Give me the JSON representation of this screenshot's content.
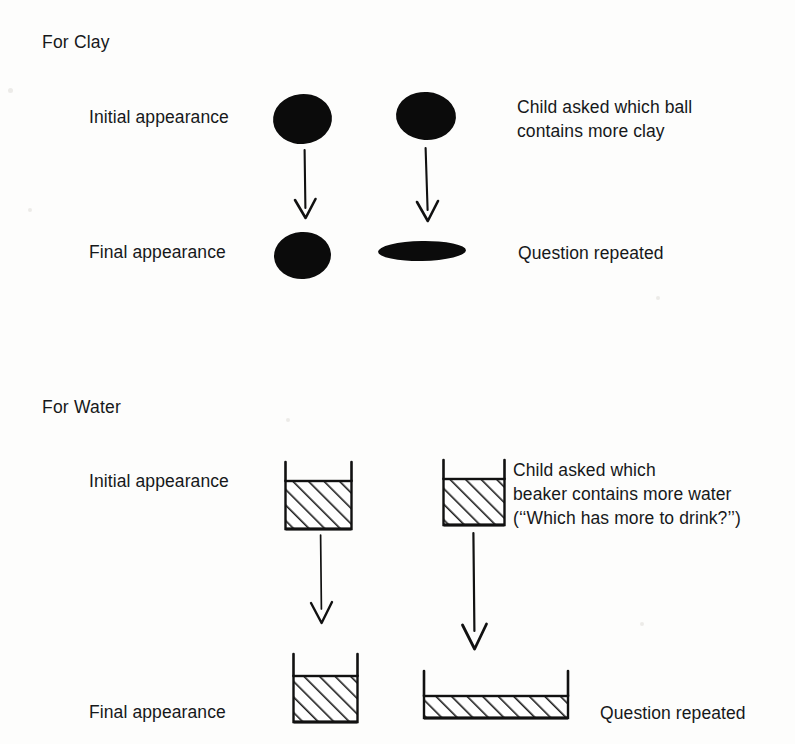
{
  "figure": {
    "title_clay": "For Clay",
    "title_water": "For Water",
    "ink_color": "#0b0b0b",
    "background_color": "#fdfdfc"
  },
  "clay_section": {
    "heading": "For Clay",
    "rows": [
      {
        "label": "Initial appearance",
        "note": "Child asked which ball\ncontains more clay",
        "note_line_1": "Child asked which ball",
        "note_line_2": "contains more clay",
        "left_shape": "circle-ball",
        "right_shape": "circle-ball"
      },
      {
        "label": "Final appearance",
        "note": "Question repeated",
        "left_shape": "circle-ball",
        "right_shape": "flattened-pancake"
      }
    ],
    "transform_arrows": 2
  },
  "water_section": {
    "heading": "For Water",
    "rows": [
      {
        "label": "Initial appearance",
        "note_line_1": "Child asked which",
        "note_line_2": "beaker contains more water",
        "note_line_3": "(‘‘Which has more to drink?’’)",
        "left_shape": "tall-beaker-filled",
        "right_shape": "tall-beaker-filled"
      },
      {
        "label": "Final appearance",
        "note": "Question repeated",
        "left_shape": "tall-beaker-filled",
        "right_shape": "wide-shallow-beaker-filled"
      }
    ],
    "transform_arrows": 2
  }
}
